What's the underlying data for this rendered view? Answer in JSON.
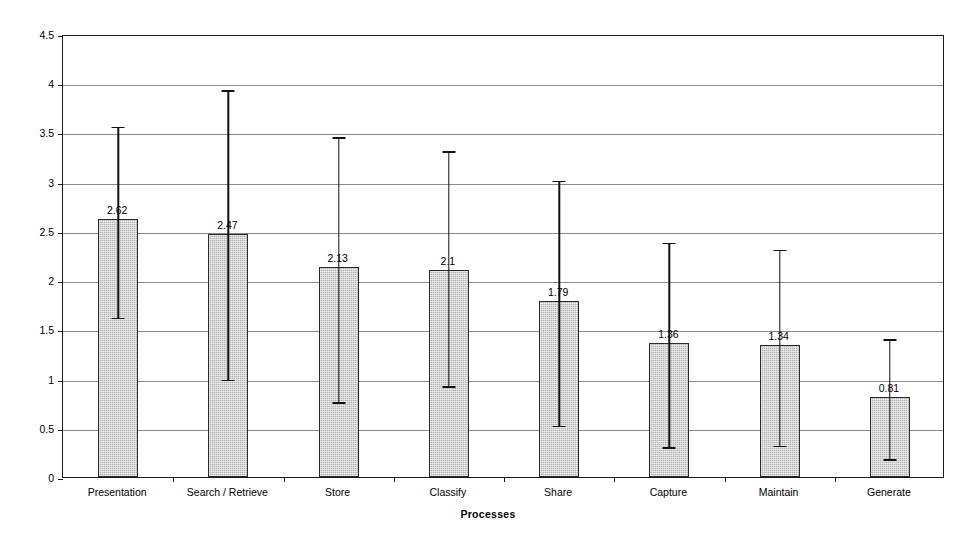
{
  "chart_data": {
    "type": "bar",
    "title": "",
    "subtitle": "",
    "xlabel": "Processes",
    "ylabel": "Mean Score (n=58)",
    "categories": [
      "Presentation",
      "Search / Retrieve",
      "Store",
      "Classify",
      "Share",
      "Capture",
      "Maintain",
      "Generate"
    ],
    "values": [
      2.62,
      2.47,
      2.13,
      2.1,
      1.79,
      1.36,
      1.34,
      0.81
    ],
    "value_labels": [
      "2.62",
      "2.47",
      "2.13",
      "2.1",
      "1.79",
      "1.36",
      "1.34",
      "0.81"
    ],
    "error_bars": {
      "lower": [
        1.64,
        1.01,
        0.78,
        0.94,
        0.54,
        0.32,
        0.34,
        0.2
      ],
      "upper": [
        3.58,
        3.95,
        3.47,
        3.33,
        3.03,
        2.4,
        2.33,
        1.42
      ]
    },
    "ylim": [
      0,
      4.5
    ],
    "ytick_values": [
      0,
      0.5,
      1,
      1.5,
      2,
      2.5,
      3,
      3.5,
      4,
      4.5
    ],
    "ytick_labels": [
      "0",
      "0.5",
      "1",
      "1.5",
      "2",
      "2.5",
      "3",
      "3.5",
      "4",
      "4.5"
    ],
    "grid": true,
    "grid_axis": "y",
    "legend": false,
    "legend_position": "none",
    "bar_fill_color": "#b2b2b2",
    "bar_border_color": "#2b2b2b",
    "errorbar_color": "#111111",
    "gridline_color": "#8a8a8a",
    "axis_color": "#1a1a1a",
    "background_color": "#ffffff",
    "series": [
      {
        "name": "Mean Score",
        "values": [
          2.62,
          2.47,
          2.13,
          2.1,
          1.79,
          1.36,
          1.34,
          0.81
        ]
      }
    ]
  }
}
